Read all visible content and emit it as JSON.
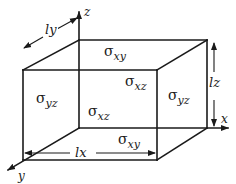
{
  "figure": {
    "type": "stress element cube",
    "axes": {
      "x": "x",
      "y": "y",
      "z": "z"
    },
    "dimensions": {
      "lx": "lx",
      "ly": "ly",
      "lz": "lz"
    },
    "stress_labels": {
      "top_face": {
        "symbol": "σ",
        "sub": "xy"
      },
      "front_face": {
        "symbol": "σ",
        "sub": "xz"
      },
      "right_face_upper": {
        "symbol": "σ",
        "sub": "xz"
      },
      "left_face": {
        "symbol": "σ",
        "sub": "yz"
      },
      "right_face": {
        "symbol": "σ",
        "sub": "yz"
      },
      "bottom_face": {
        "symbol": "σ",
        "sub": "xy"
      }
    },
    "colors": {
      "ink": "#1a1a1a",
      "background": "#ffffff"
    }
  }
}
